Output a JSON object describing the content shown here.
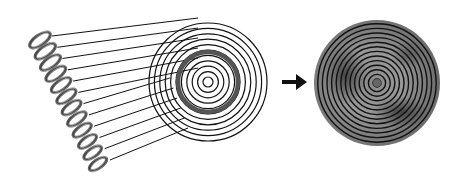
{
  "diagram": {
    "description": "Helical coil projected via fan of lines onto concentric rings, arrow pointing to resulting shaded concentric-ring disk",
    "elements": [
      {
        "id": "coil",
        "label": "helical coil"
      },
      {
        "id": "projection-lines",
        "label": "fan of projection lines"
      },
      {
        "id": "concentric-rings",
        "label": "concentric rings with highlighted ring"
      },
      {
        "id": "arrow",
        "label": "right arrow"
      },
      {
        "id": "result-disk",
        "label": "shaded concentric-ring disk"
      }
    ],
    "colors": {
      "line": "#111111",
      "coil_fill": "#8a8a8a",
      "highlight_ring": "#555555",
      "disk_dark": "#3a3a3a",
      "disk_light": "#9a9a9a"
    }
  }
}
